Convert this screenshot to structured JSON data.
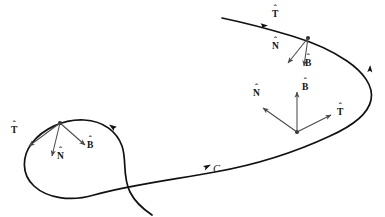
{
  "figure": {
    "background_color": "#ffffff",
    "curve_color": "#111111",
    "vector_color": "#4a4a4a",
    "label_color": "#111111",
    "curve_label": "C",
    "hat_glyph": "ˆ"
  },
  "labels": {
    "frame_left": {
      "tangent": "T",
      "normal": "N",
      "binormal": "B"
    },
    "frame_middle": {
      "tangent": "T",
      "normal": "N",
      "binormal": "B"
    },
    "frame_upper_right": {
      "tangent": "T",
      "normal": "N",
      "binormal": "B"
    }
  },
  "frames": [
    {
      "name": "frame-left",
      "origin": [
        60,
        123
      ],
      "vectors": [
        {
          "name": "tangent",
          "label": "T",
          "tip": [
            29,
            146
          ],
          "label_pos": [
            12,
            126
          ]
        },
        {
          "name": "normal",
          "label": "N",
          "tip": [
            52,
            156
          ],
          "label_pos": [
            57,
            153
          ]
        },
        {
          "name": "binormal",
          "label": "B",
          "tip": [
            85,
            145
          ],
          "label_pos": [
            88,
            143
          ]
        }
      ]
    },
    {
      "name": "frame-middle",
      "origin": [
        297,
        132
      ],
      "vectors": [
        {
          "name": "tangent",
          "label": "T",
          "tip": [
            331,
            115
          ],
          "label_pos": [
            337,
            109
          ]
        },
        {
          "name": "normal",
          "label": "N",
          "tip": [
            263,
            108
          ],
          "label_pos": [
            254,
            90
          ]
        },
        {
          "name": "binormal",
          "label": "B",
          "tip": [
            297,
            92
          ],
          "label_pos": [
            302,
            84
          ]
        }
      ]
    },
    {
      "name": "frame-upper-right",
      "origin": [
        308,
        38
      ],
      "vectors": [
        {
          "name": "tangent",
          "label": "T",
          "tip": [
            240,
            25
          ],
          "label_pos": [
            273,
            11
          ]
        },
        {
          "name": "normal",
          "label": "N",
          "tip": [
            288,
            63
          ],
          "label_pos": [
            273,
            43
          ]
        },
        {
          "name": "binormal",
          "label": "B",
          "tip": [
            304,
            66
          ],
          "label_pos": [
            306,
            60
          ]
        }
      ]
    }
  ],
  "curve": {
    "label": "C",
    "label_pos": [
      214,
      165
    ],
    "direction_markers": [
      {
        "name": "arrow-lower-mid",
        "pos": [
          206,
          163
        ]
      },
      {
        "name": "arrow-left-loop",
        "pos": [
          113,
          127
        ]
      },
      {
        "name": "arrow-right-bend",
        "pos": [
          370,
          69
        ]
      },
      {
        "name": "arrow-top-tangent",
        "pos": [
          266,
          25
        ]
      }
    ],
    "path": "M 222 18 C 246 23 272 30 292 36 C 312 42 330 50 346 61 C 362 72 373 86 370 100 C 367 115 350 127 330 136 C 300 150 260 164 215 172 C 170 180 125 186 95 195 C 70 202 48 198 35 186 C 22 174 23 157 33 144 C 44 130 63 120 84 121 C 104 122 117 133 122 146 C 127 160 123 176 131 192 C 137 204 146 211 152 215"
  }
}
